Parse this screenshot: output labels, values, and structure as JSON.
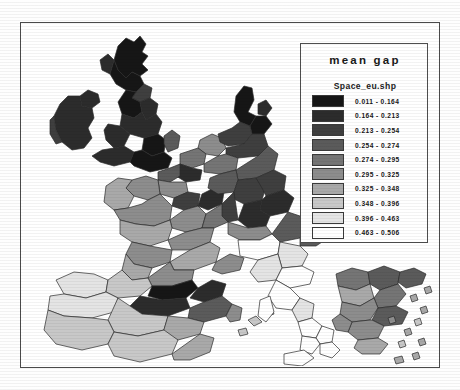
{
  "figure": {
    "type": "choropleth-map",
    "region": "Western and Southern Europe",
    "frame_color": "#4a4a4a",
    "background": "#ffffff"
  },
  "legend": {
    "title": "mean gap",
    "subtitle": "Space_eu.shp",
    "classes": [
      {
        "label": "0.011 - 0.164",
        "color": "#161616",
        "min": 0.011,
        "max": 0.164
      },
      {
        "label": "0.164 - 0.213",
        "color": "#2c2c2c",
        "min": 0.164,
        "max": 0.213
      },
      {
        "label": "0.213 - 0.254",
        "color": "#3f3f3f",
        "min": 0.213,
        "max": 0.254
      },
      {
        "label": "0.254 - 0.274",
        "color": "#5b5b5b",
        "min": 0.254,
        "max": 0.274
      },
      {
        "label": "0.274 - 0.295",
        "color": "#757575",
        "min": 0.274,
        "max": 0.295
      },
      {
        "label": "0.295 - 0.325",
        "color": "#8d8d8d",
        "min": 0.295,
        "max": 0.325
      },
      {
        "label": "0.325 - 0.348",
        "color": "#a9a9a9",
        "min": 0.325,
        "max": 0.348
      },
      {
        "label": "0.348 - 0.396",
        "color": "#c8c8c8",
        "min": 0.348,
        "max": 0.396
      },
      {
        "label": "0.396 - 0.463",
        "color": "#e4e4e4",
        "min": 0.396,
        "max": 0.463
      },
      {
        "label": "0.463 - 0.506",
        "color": "#ffffff",
        "min": 0.463,
        "max": 0.506
      }
    ]
  },
  "chart_data": {
    "type": "heatmap",
    "title": "mean gap",
    "subtitle": "Space_eu.shp",
    "value_range": [
      0.011,
      0.506
    ],
    "class_count": 10,
    "color_scheme": "grayscale dark-to-light",
    "regions": [
      {
        "name": "Scotland north",
        "class": 1
      },
      {
        "name": "Scotland central",
        "class": 1
      },
      {
        "name": "Northern Ireland",
        "class": 2
      },
      {
        "name": "Ireland west",
        "class": 2
      },
      {
        "name": "Ireland east",
        "class": 2
      },
      {
        "name": "North East England",
        "class": 1
      },
      {
        "name": "North West England",
        "class": 3
      },
      {
        "name": "Yorkshire",
        "class": 2
      },
      {
        "name": "Wales",
        "class": 2
      },
      {
        "name": "Midlands",
        "class": 1
      },
      {
        "name": "South West England",
        "class": 2
      },
      {
        "name": "South East England",
        "class": 1
      },
      {
        "name": "East Anglia",
        "class": 4
      },
      {
        "name": "Denmark",
        "class": 1
      },
      {
        "name": "Schleswig",
        "class": 1
      },
      {
        "name": "Netherlands",
        "class": 6
      },
      {
        "name": "Belgium north",
        "class": 5
      },
      {
        "name": "Belgium south",
        "class": 2
      },
      {
        "name": "Nord-Pas-de-Calais",
        "class": 4
      },
      {
        "name": "Picardie",
        "class": 6
      },
      {
        "name": "Ile-de-France",
        "class": 3
      },
      {
        "name": "Normandie",
        "class": 6
      },
      {
        "name": "Bretagne",
        "class": 7
      },
      {
        "name": "Pays de la Loire",
        "class": 6
      },
      {
        "name": "Centre",
        "class": 7
      },
      {
        "name": "Bourgogne",
        "class": 6
      },
      {
        "name": "Alsace",
        "class": 2
      },
      {
        "name": "Lorraine",
        "class": 4
      },
      {
        "name": "Champagne",
        "class": 5
      },
      {
        "name": "Franche-Comte",
        "class": 5
      },
      {
        "name": "Rhone-Alpes",
        "class": 6
      },
      {
        "name": "Auvergne",
        "class": 7
      },
      {
        "name": "Limousin",
        "class": 7
      },
      {
        "name": "Poitou-Charentes",
        "class": 7
      },
      {
        "name": "Aquitaine",
        "class": 6
      },
      {
        "name": "Midi-Pyrenees",
        "class": 6
      },
      {
        "name": "Languedoc",
        "class": 7
      },
      {
        "name": "Provence",
        "class": 6
      },
      {
        "name": "Germany north-west",
        "class": 3
      },
      {
        "name": "Germany Ruhr",
        "class": 5
      },
      {
        "name": "Germany Hessen",
        "class": 4
      },
      {
        "name": "Germany Bayern north",
        "class": 3
      },
      {
        "name": "Germany Bayern south",
        "class": 2
      },
      {
        "name": "Germany Baden",
        "class": 3
      },
      {
        "name": "Austria west",
        "class": 3
      },
      {
        "name": "Austria east",
        "class": 4
      },
      {
        "name": "Switzerland",
        "class": 6
      },
      {
        "name": "Spain Galicia",
        "class": 9
      },
      {
        "name": "Spain Asturias",
        "class": 8
      },
      {
        "name": "Spain Pais Vasco",
        "class": 1
      },
      {
        "name": "Spain Navarra",
        "class": 2
      },
      {
        "name": "Spain Castilla-Leon",
        "class": 2
      },
      {
        "name": "Spain Aragon",
        "class": 4
      },
      {
        "name": "Spain Cataluna",
        "class": 2
      },
      {
        "name": "Spain Madrid",
        "class": 8
      },
      {
        "name": "Spain Extremadura",
        "class": 8
      },
      {
        "name": "Spain Valencia",
        "class": 7
      },
      {
        "name": "Spain Andalucia",
        "class": 8
      },
      {
        "name": "Spain Murcia",
        "class": 7
      },
      {
        "name": "Portugal north",
        "class": 9
      },
      {
        "name": "Portugal centre",
        "class": 8
      },
      {
        "name": "Portugal south",
        "class": 8
      },
      {
        "name": "Balearic Islands",
        "class": 8
      },
      {
        "name": "Italy north-west",
        "class": 10
      },
      {
        "name": "Italy Lombardia",
        "class": 9
      },
      {
        "name": "Italy Veneto",
        "class": 10
      },
      {
        "name": "Italy Emilia",
        "class": 9
      },
      {
        "name": "Italy Toscana",
        "class": 10
      },
      {
        "name": "Italy Lazio",
        "class": 9
      },
      {
        "name": "Italy Campania",
        "class": 10
      },
      {
        "name": "Italy Puglia",
        "class": 10
      },
      {
        "name": "Italy Calabria",
        "class": 10
      },
      {
        "name": "Sicilia",
        "class": 10
      },
      {
        "name": "Sardegna",
        "class": 10
      },
      {
        "name": "Greece Macedonia",
        "class": 5
      },
      {
        "name": "Greece Thessalia",
        "class": 7
      },
      {
        "name": "Greece Epirus",
        "class": 8
      },
      {
        "name": "Greece Attiki",
        "class": 4
      },
      {
        "name": "Greece Peloponnisos",
        "class": 7
      },
      {
        "name": "Crete",
        "class": 8
      },
      {
        "name": "Aegean islands",
        "class": 9
      }
    ]
  }
}
